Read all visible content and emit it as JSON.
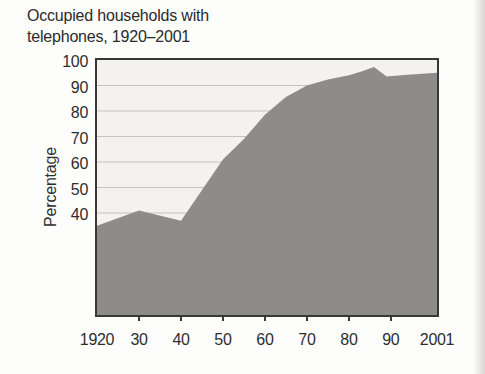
{
  "title": {
    "line1": "Occupied households with",
    "line2": "telephones, 1920–2001"
  },
  "chart_data": {
    "type": "area",
    "title": "Occupied households with telephones, 1920–2001",
    "xlabel": "",
    "ylabel": "Percentage",
    "xlim": [
      1920,
      2001
    ],
    "ylim": [
      0,
      100
    ],
    "grid": true,
    "legend": "none",
    "y_ticks": [
      40,
      50,
      60,
      70,
      80,
      90,
      100
    ],
    "x_ticks": [
      {
        "year": 1920,
        "label": "1920",
        "tick": false
      },
      {
        "year": 1930,
        "label": "30",
        "tick": true
      },
      {
        "year": 1940,
        "label": "40",
        "tick": true
      },
      {
        "year": 1950,
        "label": "50",
        "tick": true
      },
      {
        "year": 1960,
        "label": "60",
        "tick": true
      },
      {
        "year": 1970,
        "label": "70",
        "tick": true
      },
      {
        "year": 1980,
        "label": "80",
        "tick": true
      },
      {
        "year": 1990,
        "label": "90",
        "tick": true
      },
      {
        "year": 2001,
        "label": "2001",
        "tick": false
      }
    ],
    "series": [
      {
        "name": "Occupied households with telephones (%)",
        "points": [
          [
            1920,
            35
          ],
          [
            1930,
            41
          ],
          [
            1940,
            37
          ],
          [
            1950,
            61
          ],
          [
            1955,
            69
          ],
          [
            1960,
            78.5
          ],
          [
            1965,
            85.5
          ],
          [
            1970,
            90
          ],
          [
            1975,
            92.3
          ],
          [
            1980,
            94
          ],
          [
            1983,
            95.5
          ],
          [
            1986,
            97.2
          ],
          [
            1989,
            93.5
          ],
          [
            1994,
            94.2
          ],
          [
            2001,
            95
          ]
        ]
      }
    ],
    "fill_color": "#8d8c8a",
    "plot_bg": "#f3f2ee",
    "grid_color": "#c4c3c0",
    "border_color": "#383838",
    "text_color": "#2e2e2e"
  }
}
